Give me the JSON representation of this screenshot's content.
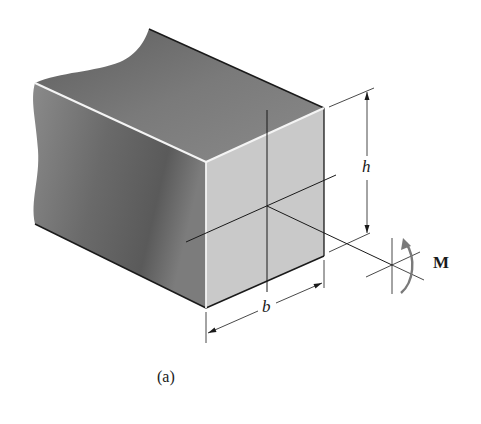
{
  "figure": {
    "caption": "(a)"
  },
  "labels": {
    "height": "h",
    "width": "b",
    "moment": "M"
  },
  "colors": {
    "top_face": "#6f6f6f",
    "side_face": "#7a7a7a",
    "front_face": "#c8c8c8",
    "edge": "#1a1a1a",
    "highlight_edge": "#f2f2f2",
    "moment_arrow": "#7a7a7a",
    "background": "#ffffff"
  }
}
